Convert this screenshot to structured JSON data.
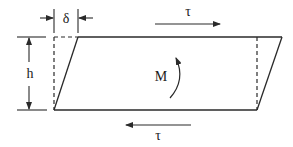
{
  "diagram": {
    "title": "",
    "labels": {
      "delta": "δ",
      "height": "h",
      "moment": "M",
      "shear_top": "τ",
      "shear_bottom": "τ"
    },
    "colors": {
      "stroke": "#2a2a2a",
      "background": "#ffffff"
    },
    "elements": [
      {
        "id": "deformed-parallelogram",
        "type": "shape"
      },
      {
        "id": "original-rectangle-dashed-edges",
        "type": "dashed-lines"
      },
      {
        "id": "delta-dimension",
        "type": "dimension",
        "label": "δ"
      },
      {
        "id": "height-dimension",
        "type": "dimension",
        "label": "h"
      },
      {
        "id": "top-shear-arrow",
        "type": "arrow",
        "direction": "right",
        "label": "τ"
      },
      {
        "id": "bottom-shear-arrow",
        "type": "arrow",
        "direction": "left",
        "label": "τ"
      },
      {
        "id": "moment-arrow",
        "type": "curved-arrow",
        "direction": "counterclockwise",
        "label": "M"
      }
    ]
  }
}
